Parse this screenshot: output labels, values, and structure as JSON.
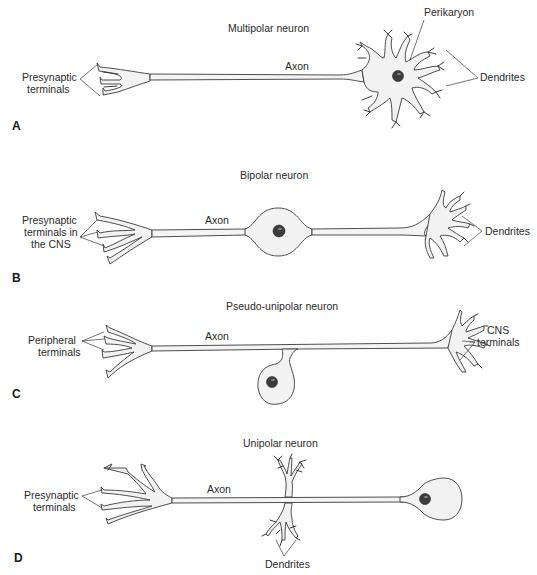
{
  "figure": {
    "panels": [
      {
        "letter": "A",
        "title": "Multipolar neuron",
        "labels": {
          "terminals": [
            "Presynaptic",
            "terminals"
          ],
          "axon": "Axon",
          "perikaryon": "Perikaryon",
          "dendrites": "Dendrites"
        }
      },
      {
        "letter": "B",
        "title": "Bipolar neuron",
        "labels": {
          "terminals": [
            "Presynaptic",
            "terminals in",
            "the CNS"
          ],
          "axon": "Axon",
          "dendrites": "Dendrites"
        }
      },
      {
        "letter": "C",
        "title": "Pseudo-unipolar neuron",
        "labels": {
          "terminals": [
            "Peripheral",
            "terminals"
          ],
          "axon": "Axon",
          "cns_terminals": [
            "CNS",
            "terminals"
          ]
        }
      },
      {
        "letter": "D",
        "title": "Unipolar neuron",
        "labels": {
          "terminals": [
            "Presynaptic",
            "terminals"
          ],
          "axon": "Axon",
          "dendrites": "Dendrites"
        }
      }
    ],
    "colors": {
      "background": "#ffffff",
      "outline": "#3a3a3a",
      "cell_fill": "#f2f2f2",
      "nucleus": "#3c3c3c",
      "text": "#2a2a2a"
    }
  }
}
